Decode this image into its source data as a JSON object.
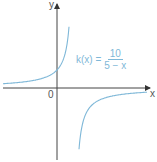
{
  "diagram": {
    "axes": {
      "x_label": "x",
      "y_label": "y",
      "origin_label": "0"
    },
    "function": {
      "name": "k(x) =",
      "numerator": "10",
      "denominator": "5 − x"
    },
    "colors": {
      "curve": "#7fb8d8",
      "axis": "#333333"
    }
  },
  "chart_data": {
    "type": "line",
    "xlabel": "x",
    "ylabel": "y",
    "vertical_asymptote": 5,
    "horizontal_asymptote": 0,
    "y_intercept": 2,
    "grid": false
  }
}
